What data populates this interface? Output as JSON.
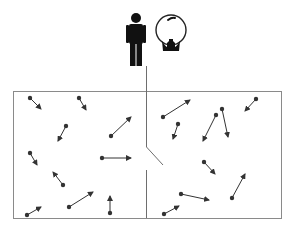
{
  "diagram": {
    "width": 292,
    "height": 233,
    "colors": {
      "background": "#ffffff",
      "box_border": "#8a8a8a",
      "partition": "#6e6e6e",
      "arrow": "#333333",
      "figure": "#111111",
      "ball_outline": "#222222"
    },
    "box": {
      "x": 13,
      "y": 91,
      "width": 268,
      "height": 127
    },
    "partition": {
      "x": 146,
      "upper_segment": {
        "y1": 0,
        "y2": 147
      },
      "trapdoor": {
        "x1": 146,
        "y1": 147,
        "x2": 163,
        "y2": 165
      },
      "lower_segment": {
        "y1": 170,
        "y2": 218
      }
    },
    "demon": {
      "person_icon": {
        "name": "person-icon",
        "head_cx": 136,
        "head_cy": 18,
        "head_r": 5
      },
      "crystal_ball_icon": {
        "name": "crystal-ball-icon",
        "cx": 171,
        "cy": 30,
        "r": 15
      }
    },
    "chambers": [
      {
        "name": "left",
        "particles": [
          {
            "x1": 30,
            "y1": 98,
            "x2": 41,
            "y2": 109
          },
          {
            "x1": 79,
            "y1": 98,
            "x2": 86,
            "y2": 110
          },
          {
            "x1": 66,
            "y1": 126,
            "x2": 58,
            "y2": 141
          },
          {
            "x1": 111,
            "y1": 136,
            "x2": 131,
            "y2": 117
          },
          {
            "x1": 30,
            "y1": 153,
            "x2": 37,
            "y2": 165
          },
          {
            "x1": 102,
            "y1": 158,
            "x2": 131,
            "y2": 158
          },
          {
            "x1": 63,
            "y1": 185,
            "x2": 53,
            "y2": 172
          },
          {
            "x1": 69,
            "y1": 207,
            "x2": 93,
            "y2": 192
          },
          {
            "x1": 27,
            "y1": 215,
            "x2": 41,
            "y2": 207
          },
          {
            "x1": 110,
            "y1": 213,
            "x2": 110,
            "y2": 196
          }
        ]
      },
      {
        "name": "right",
        "particles": [
          {
            "x1": 163,
            "y1": 117,
            "x2": 190,
            "y2": 100
          },
          {
            "x1": 178,
            "y1": 124,
            "x2": 173,
            "y2": 139
          },
          {
            "x1": 216,
            "y1": 115,
            "x2": 203,
            "y2": 141
          },
          {
            "x1": 222,
            "y1": 109,
            "x2": 228,
            "y2": 137
          },
          {
            "x1": 256,
            "y1": 99,
            "x2": 245,
            "y2": 111
          },
          {
            "x1": 204,
            "y1": 162,
            "x2": 215,
            "y2": 174
          },
          {
            "x1": 181,
            "y1": 194,
            "x2": 209,
            "y2": 200
          },
          {
            "x1": 232,
            "y1": 198,
            "x2": 245,
            "y2": 174
          },
          {
            "x1": 164,
            "y1": 214,
            "x2": 179,
            "y2": 206
          }
        ]
      }
    ]
  }
}
